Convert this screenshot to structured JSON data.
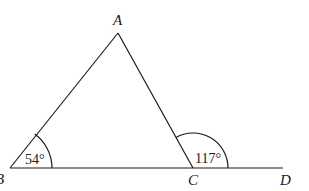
{
  "diagram": {
    "type": "geometry-triangle-exterior-angle",
    "points": {
      "A": {
        "label": "A",
        "x": 118,
        "y": 33
      },
      "B": {
        "label": "B",
        "x": 10,
        "y": 168
      },
      "C": {
        "label": "C",
        "x": 193,
        "y": 168
      },
      "D": {
        "label": "D",
        "x": 283,
        "y": 168
      }
    },
    "angles": {
      "angle_B": {
        "label": "54°",
        "vertex": "B"
      },
      "angle_ACD": {
        "label": "117°",
        "vertex": "C"
      }
    },
    "segments": [
      "AB",
      "AC",
      "BD"
    ],
    "colors": {
      "stroke": "#1a1a1a",
      "background": "#ffffff"
    }
  }
}
